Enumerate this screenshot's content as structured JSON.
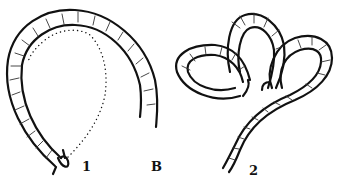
{
  "figure": {
    "labels": {
      "step_1": "1",
      "panel": "B",
      "step_2": "2"
    },
    "parts": [
      {
        "id": "step-1",
        "description": "Single rope loop (horseshoe bend) with dotted line showing path of working end, small turn at lower-left end"
      },
      {
        "id": "step-2",
        "description": "Rope formed into three loops (figure resembling a clover/heart) with standing part descending to lower-left"
      }
    ],
    "colors": {
      "line": "#111111",
      "background": "#ffffff"
    }
  }
}
